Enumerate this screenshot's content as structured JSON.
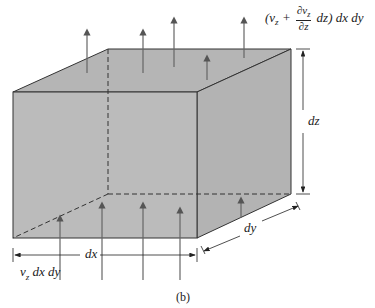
{
  "figure": {
    "caption": "(b)",
    "labels": {
      "dx": "dx",
      "dy": "dy",
      "dz": "dz",
      "inflow": "v",
      "inflow_sub": "z",
      "inflow_rest": " dx dy",
      "outflow_open": "(v",
      "outflow_sub": "z",
      "outflow_plus": " + ",
      "outflow_num": "∂v",
      "outflow_num_sub": "z",
      "outflow_den": "∂z",
      "outflow_close": " dz) dx dy"
    },
    "colors": {
      "face": "#b8b8b8",
      "edge": "#333333",
      "arrow": "#666666"
    }
  }
}
